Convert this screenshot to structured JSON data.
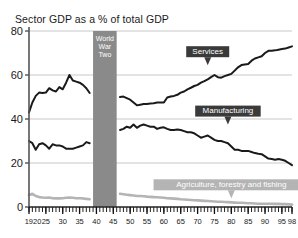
{
  "chart_data": {
    "type": "line",
    "title": "Sector GDP as a % of total GDP",
    "xlabel": "",
    "ylabel": "",
    "xlim": [
      1920,
      1998
    ],
    "ylim": [
      0,
      80
    ],
    "grid": true,
    "legend_position": "inline-annotations",
    "y_ticks": [
      "0",
      "20",
      "40",
      "60",
      "80"
    ],
    "y_tick_values": [
      0,
      20,
      40,
      60,
      80
    ],
    "x_ticks": [
      "1920",
      "25",
      "30",
      "35",
      "40",
      "45",
      "50",
      "55",
      "60",
      "65",
      "70",
      "75",
      "80",
      "85",
      "90",
      "95",
      "98"
    ],
    "x_tick_values": [
      1920,
      1925,
      1930,
      1935,
      1940,
      1945,
      1950,
      1955,
      1960,
      1965,
      1970,
      1975,
      1980,
      1985,
      1990,
      1995,
      1998
    ],
    "annotations": [
      {
        "name": "world-war-two-band",
        "text": "World War Two",
        "lines": [
          "World",
          "War",
          "Two"
        ],
        "x_start": 1939,
        "x_end": 1946,
        "color": "#8a8a8a"
      },
      {
        "name": "services-label",
        "text": "Services",
        "x": 1973,
        "y": 69,
        "color": "#3a3a3a"
      },
      {
        "name": "manufacturing-label",
        "text": "Manufacturing",
        "x": 1979,
        "y": 42,
        "color": "#3a3a3a"
      },
      {
        "name": "agriculture-label",
        "text": "Agriculture, forestry and fishing",
        "x": 1980,
        "y": 8.5,
        "color": "#b4b4b4"
      }
    ],
    "series": [
      {
        "name": "Services",
        "color": "#1a1a1a",
        "segments": [
          {
            "x": [
              1920,
              1921,
              1922,
              1923,
              1924,
              1925,
              1926,
              1927,
              1928,
              1929,
              1930,
              1931,
              1932,
              1933,
              1934,
              1935,
              1936,
              1937,
              1938
            ],
            "values": [
              43.0,
              47.5,
              50.5,
              52.0,
              51.8,
              52.0,
              54.0,
              53.0,
              52.5,
              54.5,
              53.5,
              56.5,
              60.0,
              57.5,
              57.0,
              56.5,
              55.5,
              54.0,
              51.8
            ]
          },
          {
            "x": [
              1947,
              1948,
              1949,
              1950,
              1951,
              1952,
              1953,
              1954,
              1955,
              1956,
              1957,
              1958,
              1959,
              1960,
              1961,
              1962,
              1963,
              1964,
              1965,
              1966,
              1967,
              1968,
              1969,
              1970,
              1971,
              1972,
              1973,
              1974,
              1975,
              1976,
              1977,
              1978,
              1979,
              1980,
              1981,
              1982,
              1983,
              1984,
              1985,
              1986,
              1987,
              1988,
              1989,
              1990,
              1991,
              1992,
              1993,
              1994,
              1995,
              1996,
              1997,
              1998
            ],
            "values": [
              50.0,
              50.2,
              49.5,
              48.8,
              47.5,
              46.2,
              46.5,
              46.8,
              46.8,
              47.0,
              47.2,
              47.5,
              47.5,
              47.5,
              49.8,
              50.2,
              50.5,
              51.0,
              52.0,
              52.5,
              53.5,
              54.2,
              55.0,
              55.5,
              56.5,
              57.2,
              58.0,
              59.0,
              60.0,
              59.0,
              58.8,
              59.5,
              60.0,
              60.5,
              62.0,
              63.5,
              64.5,
              64.8,
              65.0,
              66.5,
              67.5,
              68.0,
              68.5,
              70.0,
              71.0,
              71.0,
              71.2,
              71.5,
              71.8,
              72.0,
              72.5,
              73.0
            ]
          }
        ]
      },
      {
        "name": "Manufacturing",
        "color": "#1a1a1a",
        "segments": [
          {
            "x": [
              1920,
              1921,
              1922,
              1923,
              1924,
              1925,
              1926,
              1927,
              1928,
              1929,
              1930,
              1931,
              1932,
              1933,
              1934,
              1935,
              1936,
              1937,
              1938
            ],
            "values": [
              30.0,
              29.0,
              26.0,
              28.5,
              29.0,
              28.0,
              26.5,
              28.5,
              28.0,
              28.0,
              27.5,
              26.5,
              26.5,
              26.5,
              27.0,
              27.5,
              28.0,
              29.5,
              29.0
            ]
          },
          {
            "x": [
              1947,
              1948,
              1949,
              1950,
              1951,
              1952,
              1953,
              1954,
              1955,
              1956,
              1957,
              1958,
              1959,
              1960,
              1961,
              1962,
              1963,
              1964,
              1965,
              1966,
              1967,
              1968,
              1969,
              1970,
              1971,
              1972,
              1973,
              1974,
              1975,
              1976,
              1977,
              1978,
              1979,
              1980,
              1981,
              1982,
              1983,
              1984,
              1985,
              1986,
              1987,
              1988,
              1989,
              1990,
              1991,
              1992,
              1993,
              1994,
              1995,
              1996,
              1997,
              1998
            ],
            "values": [
              35.0,
              35.5,
              36.5,
              36.0,
              37.5,
              36.0,
              37.0,
              37.5,
              37.0,
              36.5,
              36.5,
              35.5,
              36.0,
              36.2,
              35.5,
              35.0,
              35.0,
              35.2,
              35.0,
              34.5,
              34.0,
              34.0,
              33.5,
              32.5,
              31.5,
              32.0,
              32.5,
              31.5,
              30.5,
              30.0,
              30.0,
              29.5,
              29.0,
              27.5,
              26.0,
              26.0,
              25.5,
              25.5,
              25.5,
              25.0,
              24.5,
              24.2,
              24.0,
              23.0,
              22.0,
              21.8,
              21.5,
              21.8,
              21.5,
              21.0,
              20.0,
              19.0
            ]
          }
        ]
      },
      {
        "name": "Agriculture, forestry and fishing",
        "color": "#b4b4b4",
        "segments": [
          {
            "x": [
              1920,
              1921,
              1922,
              1923,
              1924,
              1925,
              1926,
              1927,
              1928,
              1929,
              1930,
              1931,
              1932,
              1933,
              1934,
              1935,
              1936,
              1937,
              1938
            ],
            "values": [
              5.5,
              6.0,
              5.0,
              4.5,
              4.3,
              4.2,
              4.3,
              4.0,
              3.9,
              3.9,
              4.0,
              4.2,
              4.3,
              4.2,
              4.0,
              4.0,
              3.9,
              3.7,
              3.5
            ]
          },
          {
            "x": [
              1947,
              1948,
              1949,
              1950,
              1951,
              1952,
              1953,
              1954,
              1955,
              1956,
              1957,
              1958,
              1959,
              1960,
              1961,
              1962,
              1963,
              1964,
              1965,
              1966,
              1967,
              1968,
              1969,
              1970,
              1971,
              1972,
              1973,
              1974,
              1975,
              1976,
              1977,
              1978,
              1979,
              1980,
              1981,
              1982,
              1983,
              1984,
              1985,
              1986,
              1987,
              1988,
              1989,
              1990,
              1991,
              1992,
              1993,
              1994,
              1995,
              1996,
              1997,
              1998
            ],
            "values": [
              6.0,
              5.8,
              5.6,
              5.4,
              5.2,
              5.0,
              5.0,
              4.9,
              4.7,
              4.6,
              4.5,
              4.4,
              4.3,
              4.2,
              4.0,
              3.9,
              3.8,
              3.7,
              3.5,
              3.4,
              3.3,
              3.2,
              3.1,
              3.0,
              2.9,
              2.8,
              2.7,
              2.6,
              2.5,
              2.4,
              2.4,
              2.3,
              2.2,
              2.1,
              2.0,
              1.9,
              1.9,
              1.8,
              1.7,
              1.7,
              1.6,
              1.5,
              1.5,
              1.5,
              1.5,
              1.5,
              1.4,
              1.4,
              1.3,
              1.3,
              1.2,
              1.1
            ]
          }
        ]
      }
    ]
  },
  "colors": {
    "axis": "#555555",
    "grid": "#c8c8c8",
    "background": "#ffffff",
    "dark_series": "#1a1a1a",
    "light_series": "#b4b4b4",
    "war_band": "#8a8a8a",
    "dark_box": "#3a3a3a"
  }
}
